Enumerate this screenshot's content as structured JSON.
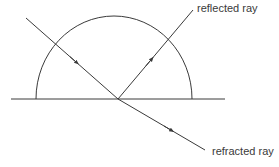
{
  "diagram": {
    "labels": {
      "reflected": "reflected ray",
      "refracted": "refracted ray"
    },
    "colors": {
      "stroke": "#3a3a3a",
      "background": "#ffffff"
    }
  }
}
